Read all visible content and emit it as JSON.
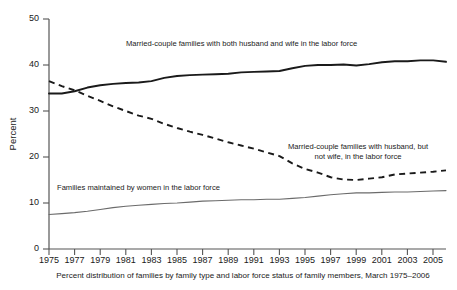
{
  "chart_data": {
    "type": "line",
    "title": "",
    "caption": "Percent distribution of families by family type and labor force status of family members, March 1975–2006",
    "xlabel": "",
    "ylabel": "Percent",
    "xlim": [
      1975,
      2006
    ],
    "ylim": [
      0,
      50
    ],
    "yticks": [
      0,
      10,
      20,
      30,
      40,
      50
    ],
    "ytick_labels": [
      "0",
      "10",
      "20",
      "30",
      "40",
      "50"
    ],
    "xticks": [
      1975,
      1977,
      1979,
      1981,
      1983,
      1985,
      1987,
      1989,
      1991,
      1993,
      1995,
      1997,
      1999,
      2001,
      2003,
      2005
    ],
    "xtick_labels": [
      "1975",
      "1977",
      "1979",
      "1981",
      "1983",
      "1985",
      "1987",
      "1989",
      "1991",
      "1993",
      "1995",
      "1997",
      "1999",
      "2001",
      "2003",
      "2005"
    ],
    "grid": false,
    "legend_position": "inline-annotations",
    "x": [
      1975,
      1976,
      1977,
      1978,
      1979,
      1980,
      1981,
      1982,
      1983,
      1984,
      1985,
      1986,
      1987,
      1988,
      1989,
      1990,
      1991,
      1992,
      1993,
      1994,
      1995,
      1996,
      1997,
      1998,
      1999,
      2000,
      2001,
      2002,
      2003,
      2004,
      2005,
      2006
    ],
    "series": [
      {
        "name": "Married-couple families with both husband and wife in the labor force",
        "style": "solid-thick",
        "color": "#1a1a1a",
        "values": [
          33.8,
          33.8,
          34.3,
          35.1,
          35.6,
          35.9,
          36.1,
          36.2,
          36.5,
          37.2,
          37.6,
          37.8,
          37.9,
          38.0,
          38.1,
          38.4,
          38.5,
          38.6,
          38.7,
          39.3,
          39.8,
          40.0,
          40.0,
          40.1,
          39.9,
          40.2,
          40.6,
          40.8,
          40.8,
          41.0,
          41.0,
          40.7
        ]
      },
      {
        "name": "Married-couple families with husband, but not wife, in the labor force",
        "style": "dashed",
        "color": "#1a1a1a",
        "values": [
          36.5,
          35.4,
          34.5,
          33.3,
          32.2,
          31.0,
          30.0,
          29.0,
          28.3,
          27.2,
          26.3,
          25.5,
          24.8,
          24.0,
          23.2,
          22.5,
          21.8,
          21.0,
          20.2,
          18.6,
          17.4,
          16.6,
          15.6,
          15.1,
          15.0,
          15.3,
          15.6,
          16.2,
          16.4,
          16.6,
          16.8,
          17.1
        ]
      },
      {
        "name": "Families maintained by women in the labor force",
        "style": "thin",
        "color": "#6b6b6b",
        "values": [
          7.5,
          7.7,
          7.9,
          8.2,
          8.6,
          9.0,
          9.3,
          9.5,
          9.7,
          9.9,
          10.0,
          10.2,
          10.4,
          10.5,
          10.6,
          10.7,
          10.7,
          10.8,
          10.8,
          11.0,
          11.2,
          11.5,
          11.8,
          12.0,
          12.2,
          12.2,
          12.3,
          12.4,
          12.4,
          12.5,
          12.6,
          12.7
        ]
      }
    ],
    "annotations": [
      {
        "name": "annotation-both-spouses",
        "text": "Married-couple families with both husband and wife in the labor force",
        "align": "start"
      },
      {
        "name": "annotation-husband-only-line1",
        "text": "Married-couple families with husband, but",
        "align": "middle"
      },
      {
        "name": "annotation-husband-only-line2",
        "text": "not wife, in the labor force",
        "align": "middle"
      },
      {
        "name": "annotation-women-maintained",
        "text": "Families maintained by women in the labor force",
        "align": "start"
      }
    ]
  }
}
